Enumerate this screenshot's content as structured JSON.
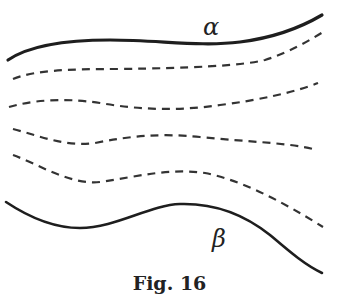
{
  "figure": {
    "caption": "Fig. 16",
    "labels": {
      "alpha": "α",
      "beta": "β"
    },
    "curves": [
      {
        "name": "alpha",
        "style": "solid"
      },
      {
        "name": "dashed-1",
        "style": "dashed"
      },
      {
        "name": "dashed-2",
        "style": "dashed"
      },
      {
        "name": "dashed-3",
        "style": "dashed"
      },
      {
        "name": "dashed-4",
        "style": "dashed"
      },
      {
        "name": "beta",
        "style": "solid"
      }
    ]
  }
}
